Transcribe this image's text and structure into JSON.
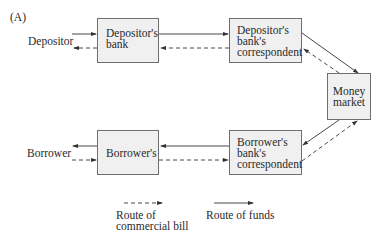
{
  "panel_label": "(A)",
  "nodes": {
    "depositor": "Depositor",
    "depositors_bank": "Depositor's\nbank",
    "depositors_correspondent": "Depositor's\nbank's\ncorrespondent",
    "money_market": "Money\nmarket",
    "borrowers_bank": "Borrower's",
    "borrowers_correspondent": "Borrower's\nbank's\ncorrespondent",
    "borrower": "Borrower"
  },
  "legend": {
    "commercial_bill": "Route of\ncommercial bill",
    "funds": "Route of funds"
  },
  "edges": [
    {
      "from": "depositor",
      "to": "depositors_bank",
      "type": "funds"
    },
    {
      "from": "depositors_bank",
      "to": "depositor",
      "type": "commercial_bill"
    },
    {
      "from": "depositors_bank",
      "to": "depositors_correspondent",
      "type": "funds"
    },
    {
      "from": "depositors_correspondent",
      "to": "depositors_bank",
      "type": "commercial_bill"
    },
    {
      "from": "depositors_correspondent",
      "to": "money_market",
      "type": "funds"
    },
    {
      "from": "money_market",
      "to": "depositors_correspondent",
      "type": "commercial_bill"
    },
    {
      "from": "money_market",
      "to": "borrowers_correspondent",
      "type": "funds"
    },
    {
      "from": "borrowers_correspondent",
      "to": "money_market",
      "type": "commercial_bill"
    },
    {
      "from": "borrowers_correspondent",
      "to": "borrowers_bank",
      "type": "funds"
    },
    {
      "from": "borrowers_bank",
      "to": "borrowers_correspondent",
      "type": "commercial_bill"
    },
    {
      "from": "borrowers_bank",
      "to": "borrower",
      "type": "funds"
    },
    {
      "from": "borrower",
      "to": "borrowers_bank",
      "type": "commercial_bill"
    }
  ],
  "colors": {
    "box_fill": "#f0f0f0",
    "box_border": "#6e6e6e",
    "line": "#333333"
  }
}
